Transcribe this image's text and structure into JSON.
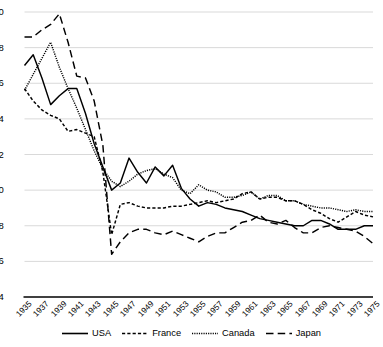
{
  "chart_data": {
    "type": "line",
    "title": "",
    "xlabel": "",
    "ylabel": "",
    "ylim": [
      4,
      20
    ],
    "ytick_values": [
      4,
      6,
      8,
      10,
      12,
      14,
      16,
      18,
      20
    ],
    "ytick_labels": [
      "4",
      "6",
      "8",
      "10",
      "12",
      "14",
      "16",
      "18",
      "20"
    ],
    "grid": true,
    "grid_color": "#d9d9d9",
    "legend_position": "bottom",
    "xlim": [
      1935,
      1975
    ],
    "x": [
      1935,
      1936,
      1937,
      1938,
      1939,
      1940,
      1941,
      1942,
      1943,
      1944,
      1945,
      1946,
      1947,
      1948,
      1949,
      1950,
      1951,
      1952,
      1953,
      1954,
      1955,
      1956,
      1957,
      1958,
      1959,
      1960,
      1961,
      1962,
      1963,
      1964,
      1965,
      1966,
      1967,
      1968,
      1969,
      1970,
      1971,
      1972,
      1973,
      1974,
      1975
    ],
    "xtick_labels": [
      "1935",
      "1937",
      "1939",
      "1941",
      "1943",
      "1945",
      "1947",
      "1949",
      "1951",
      "1953",
      "1955",
      "1957",
      "1959",
      "1961",
      "1963",
      "1965",
      "1967",
      "1969",
      "1971",
      "1973",
      "1975"
    ],
    "series": [
      {
        "name": "USA",
        "style": "solid",
        "color": "#000000",
        "values": [
          17.0,
          17.6,
          16.3,
          14.8,
          15.3,
          15.7,
          15.7,
          14.3,
          12.6,
          11.3,
          10.0,
          10.4,
          11.8,
          11.0,
          10.4,
          11.3,
          10.8,
          11.4,
          10.1,
          9.5,
          9.1,
          9.3,
          9.2,
          9.0,
          8.9,
          8.8,
          8.6,
          8.4,
          8.3,
          8.2,
          8.1,
          8.0,
          8.0,
          8.3,
          8.3,
          8.1,
          7.8,
          7.8,
          7.8,
          8.0,
          8.0
        ]
      },
      {
        "name": "France",
        "style": "dashed",
        "color": "#000000",
        "values": [
          15.7,
          15.0,
          14.5,
          14.2,
          14.0,
          13.3,
          13.4,
          13.2,
          13.0,
          11.0,
          7.5,
          9.2,
          9.3,
          9.1,
          9.0,
          9.0,
          9.0,
          9.1,
          9.1,
          9.2,
          9.3,
          9.4,
          9.3,
          9.4,
          9.5,
          9.8,
          9.9,
          9.5,
          9.6,
          9.6,
          9.4,
          9.4,
          9.2,
          8.9,
          8.7,
          8.4,
          8.2,
          8.5,
          8.8,
          8.6,
          8.5
        ]
      },
      {
        "name": "Canada",
        "style": "dotted",
        "color": "#000000",
        "values": [
          15.6,
          16.5,
          17.4,
          18.3,
          16.9,
          15.7,
          14.6,
          13.4,
          12.2,
          11.2,
          10.5,
          10.2,
          10.5,
          10.9,
          11.1,
          11.2,
          10.9,
          10.7,
          10.0,
          9.8,
          10.3,
          10.0,
          9.9,
          9.6,
          9.6,
          9.7,
          9.9,
          9.5,
          9.7,
          9.7,
          9.4,
          9.4,
          9.2,
          9.1,
          9.0,
          9.0,
          8.9,
          8.8,
          8.9,
          8.8,
          8.8
        ]
      },
      {
        "name": "Japan",
        "style": "longdash",
        "color": "#000000",
        "values": [
          18.6,
          18.6,
          19.0,
          19.3,
          19.9,
          18.3,
          16.4,
          16.3,
          15.0,
          12.5,
          6.4,
          7.1,
          7.6,
          7.8,
          7.8,
          7.6,
          7.5,
          7.7,
          7.5,
          7.3,
          7.1,
          7.4,
          7.6,
          7.6,
          7.9,
          8.2,
          8.3,
          8.6,
          8.2,
          8.1,
          8.3,
          7.9,
          7.6,
          7.6,
          7.9,
          8.0,
          7.9,
          7.8,
          7.7,
          7.4,
          7.0
        ]
      }
    ]
  },
  "legend": {
    "items": [
      {
        "label": "USA",
        "swatch": "solid-line-swatch"
      },
      {
        "label": "France",
        "swatch": "dashed-line-swatch"
      },
      {
        "label": "Canada",
        "swatch": "dotted-line-swatch"
      },
      {
        "label": "Japan",
        "swatch": "longdash-line-swatch"
      }
    ]
  }
}
